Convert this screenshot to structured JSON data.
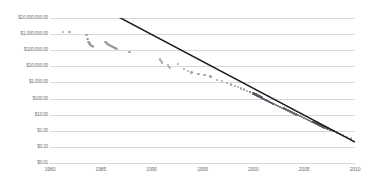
{
  "chart_data": {
    "type": "scatter",
    "title": "",
    "subtitle": "",
    "xlabel": "",
    "ylabel": "",
    "xlim": [
      1980,
      2010
    ],
    "ylim_log": [
      0.01,
      10000000
    ],
    "y_scale": "log",
    "grid": true,
    "legend": "none",
    "x_ticks": [
      "1980",
      "1985",
      "1990",
      "1995",
      "2000",
      "2005",
      "2010"
    ],
    "x_tick_values": [
      1980,
      1985,
      1990,
      1995,
      2000,
      2005,
      2010
    ],
    "y_ticks": [
      "$10,000,000.00",
      "$1,000,000.00",
      "$100,000.00",
      "$10,000.00",
      "$1,000.00",
      "$100.00",
      "$10.00",
      "$1.00",
      "$0.10",
      "$0.01"
    ],
    "y_tick_values": [
      10000000,
      1000000,
      100000,
      10000,
      1000,
      100,
      10,
      1,
      0.1,
      0.01
    ],
    "marker_color": "#8d8a9b",
    "dense_marker_color": "#4b4954",
    "trendline_color": "#1a1a1a",
    "gridline_color": "#d8d8d8",
    "axis_color": "#b0b0b0",
    "background_color": "#ffffff",
    "series": [
      {
        "name": "observations",
        "points": [
          [
            1981.3,
            1400000
          ],
          [
            1981.9,
            1300000
          ],
          [
            1983.6,
            900000
          ],
          [
            1983.7,
            520000
          ],
          [
            1983.8,
            330000
          ],
          [
            1983.9,
            260000
          ],
          [
            1984.0,
            210000
          ],
          [
            1984.1,
            190000
          ],
          [
            1984.2,
            175000
          ],
          [
            1985.4,
            330000
          ],
          [
            1985.5,
            300000
          ],
          [
            1985.6,
            260000
          ],
          [
            1985.7,
            230000
          ],
          [
            1985.8,
            210000
          ],
          [
            1985.9,
            195000
          ],
          [
            1986.0,
            180000
          ],
          [
            1986.1,
            170000
          ],
          [
            1986.2,
            160000
          ],
          [
            1986.3,
            150000
          ],
          [
            1986.4,
            140000
          ],
          [
            1986.5,
            130000
          ],
          [
            1986.6,
            120000
          ],
          [
            1987.8,
            80000
          ],
          [
            1990.8,
            26000
          ],
          [
            1990.9,
            21000
          ],
          [
            1991.0,
            17000
          ],
          [
            1991.6,
            12000
          ],
          [
            1991.7,
            9500
          ],
          [
            1991.8,
            8200
          ],
          [
            1992.6,
            14000
          ],
          [
            1993.2,
            7000
          ],
          [
            1993.6,
            5200
          ],
          [
            1993.9,
            4100
          ],
          [
            1994.6,
            3400
          ],
          [
            1995.2,
            2900
          ],
          [
            1995.8,
            2300
          ],
          [
            1996.4,
            1400
          ],
          [
            1996.9,
            1250
          ],
          [
            1997.4,
            900
          ],
          [
            1997.8,
            760
          ],
          [
            1998.2,
            610
          ],
          [
            1998.5,
            520
          ],
          [
            1998.8,
            430
          ],
          [
            1999.1,
            360
          ],
          [
            1999.4,
            300
          ],
          [
            1999.7,
            250
          ],
          [
            2000.0,
            210
          ],
          [
            2000.2,
            180
          ],
          [
            2000.4,
            155
          ],
          [
            2000.6,
            132
          ],
          [
            2000.8,
            115
          ],
          [
            2001.0,
            98
          ],
          [
            2001.2,
            85
          ],
          [
            2001.4,
            73
          ],
          [
            2001.6,
            63
          ],
          [
            2001.8,
            55
          ],
          [
            2002.0,
            47
          ],
          [
            2002.2,
            41
          ],
          [
            2002.4,
            36
          ],
          [
            2002.6,
            31
          ],
          [
            2002.8,
            27
          ],
          [
            2003.0,
            24
          ],
          [
            2003.2,
            21
          ],
          [
            2003.4,
            18
          ],
          [
            2003.6,
            16
          ],
          [
            2003.8,
            14
          ],
          [
            2004.0,
            12
          ],
          [
            2004.2,
            10.5
          ],
          [
            2004.4,
            9.2
          ],
          [
            2004.6,
            8.0
          ],
          [
            2004.8,
            7.0
          ],
          [
            2005.0,
            6.2
          ],
          [
            2005.2,
            5.4
          ],
          [
            2005.4,
            4.7
          ],
          [
            2005.6,
            4.1
          ],
          [
            2005.8,
            3.6
          ],
          [
            2006.0,
            3.2
          ],
          [
            2006.2,
            2.8
          ],
          [
            2006.4,
            2.4
          ],
          [
            2006.6,
            2.1
          ],
          [
            2006.8,
            1.85
          ],
          [
            2007.0,
            1.62
          ],
          [
            2007.3,
            1.35
          ],
          [
            2007.6,
            1.12
          ],
          [
            2007.9,
            0.93
          ],
          [
            2008.2,
            0.78
          ],
          [
            2008.5,
            0.65
          ],
          [
            2008.8,
            0.55
          ],
          [
            2009.2,
            0.42
          ],
          [
            2009.6,
            0.33
          ]
        ]
      }
    ],
    "trendline": {
      "name": "log-linear fit",
      "start": [
        1980.6,
        1300000000
      ],
      "end": [
        2010.0,
        0.2
      ]
    }
  }
}
